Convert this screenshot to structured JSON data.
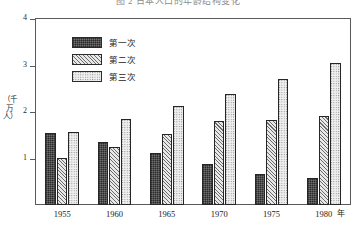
{
  "chart_data": {
    "type": "bar",
    "title": "图 2  日本人口的年龄结构变化",
    "xlabel": "年",
    "ylabel": "（千万人）",
    "categories": [
      "1955",
      "1960",
      "1965",
      "1970",
      "1975",
      "1980"
    ],
    "series": [
      {
        "name": "第一次",
        "pattern": "dark-dot",
        "values": [
          1.55,
          1.35,
          1.12,
          0.88,
          0.67,
          0.58
        ]
      },
      {
        "name": "第二次",
        "pattern": "diagonal-hatch",
        "values": [
          1.02,
          1.25,
          1.52,
          1.8,
          1.83,
          1.92
        ]
      },
      {
        "name": "第三次",
        "pattern": "light-dot",
        "values": [
          1.58,
          1.85,
          2.12,
          2.38,
          2.7,
          3.05
        ]
      }
    ],
    "ylim": [
      0,
      4
    ],
    "yticks": [
      "1",
      "2",
      "3",
      "4"
    ],
    "grid": false,
    "legend_position": "top-left-inside"
  },
  "axes": {
    "y_title": "（千万人）",
    "y_tick_4": "4",
    "y_tick_3": "3",
    "y_tick_2": "2",
    "y_tick_1": "1",
    "x_unit": "年",
    "x_tick_0": "1955",
    "x_tick_1": "1960",
    "x_tick_2": "1965",
    "x_tick_3": "1970",
    "x_tick_4": "1975",
    "x_tick_5": "1980"
  },
  "legend": {
    "items": [
      {
        "label": "第一次"
      },
      {
        "label": "第二次"
      },
      {
        "label": "第三次"
      }
    ]
  },
  "title": "图 2  日本人口的年龄结构变化"
}
